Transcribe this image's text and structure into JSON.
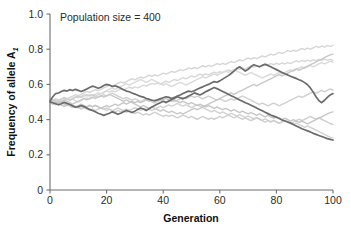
{
  "chart_data": {
    "type": "line",
    "title": "",
    "annotation": "Population size = 400",
    "xlabel": "Generation",
    "ylabel": "Frequency of allele A",
    "ylabel_subscript": "1",
    "xlim": [
      0,
      100
    ],
    "ylim": [
      0,
      1.0
    ],
    "x_ticks": [
      0,
      20,
      40,
      60,
      80,
      100
    ],
    "x_tick_labels": [
      "0",
      "20",
      "40",
      "60",
      "80",
      "100"
    ],
    "y_ticks": [
      0,
      0.2,
      0.4,
      0.6,
      0.8,
      1.0
    ],
    "y_tick_labels": [
      "0",
      "0.2",
      "0.4",
      "0.6",
      "0.8",
      "1.0"
    ],
    "grid": false,
    "legend": "none",
    "x_step": 1,
    "colors": {
      "dark_line": "#6b6b6b",
      "light_line": "#d4d4d4",
      "mid_line": "#c2c2c2",
      "axis": "#6e6e6e",
      "text": "#2b2b2b"
    },
    "series": [
      {
        "name": "replicate-1-dark",
        "color": "#6b6b6b",
        "width": 1.7,
        "values": [
          0.506,
          0.53,
          0.548,
          0.551,
          0.56,
          0.566,
          0.562,
          0.57,
          0.565,
          0.572,
          0.566,
          0.56,
          0.566,
          0.574,
          0.582,
          0.59,
          0.585,
          0.578,
          0.584,
          0.594,
          0.6,
          0.596,
          0.588,
          0.592,
          0.586,
          0.578,
          0.57,
          0.562,
          0.558,
          0.551,
          0.545,
          0.538,
          0.532,
          0.528,
          0.52,
          0.516,
          0.51,
          0.508,
          0.512,
          0.518,
          0.524,
          0.53,
          0.526,
          0.52,
          0.526,
          0.534,
          0.54,
          0.548,
          0.556,
          0.562,
          0.558,
          0.564,
          0.572,
          0.58,
          0.586,
          0.594,
          0.6,
          0.608,
          0.616,
          0.612,
          0.62,
          0.63,
          0.64,
          0.65,
          0.662,
          0.676,
          0.69,
          0.7,
          0.688,
          0.676,
          0.686,
          0.7,
          0.712,
          0.706,
          0.7,
          0.708,
          0.714,
          0.708,
          0.7,
          0.692,
          0.684,
          0.676,
          0.668,
          0.66,
          0.654,
          0.646,
          0.64,
          0.634,
          0.626,
          0.62,
          0.61,
          0.598,
          0.58,
          0.556,
          0.53,
          0.508,
          0.496,
          0.51,
          0.526,
          0.54,
          0.548
        ]
      },
      {
        "name": "replicate-2-dark",
        "color": "#6b6b6b",
        "width": 1.7,
        "values": [
          0.5,
          0.496,
          0.49,
          0.484,
          0.49,
          0.498,
          0.492,
          0.486,
          0.478,
          0.47,
          0.474,
          0.48,
          0.474,
          0.466,
          0.458,
          0.452,
          0.444,
          0.436,
          0.43,
          0.424,
          0.43,
          0.436,
          0.444,
          0.438,
          0.43,
          0.436,
          0.444,
          0.452,
          0.446,
          0.44,
          0.448,
          0.458,
          0.466,
          0.46,
          0.452,
          0.462,
          0.472,
          0.48,
          0.488,
          0.496,
          0.504,
          0.498,
          0.506,
          0.514,
          0.522,
          0.53,
          0.524,
          0.518,
          0.526,
          0.534,
          0.542,
          0.552,
          0.546,
          0.54,
          0.548,
          0.558,
          0.566,
          0.574,
          0.582,
          0.576,
          0.568,
          0.56,
          0.552,
          0.544,
          0.536,
          0.528,
          0.52,
          0.512,
          0.504,
          0.496,
          0.49,
          0.482,
          0.474,
          0.466,
          0.458,
          0.45,
          0.442,
          0.434,
          0.426,
          0.42,
          0.414,
          0.406,
          0.398,
          0.392,
          0.386,
          0.38,
          0.372,
          0.364,
          0.356,
          0.348,
          0.342,
          0.336,
          0.33,
          0.322,
          0.316,
          0.31,
          0.304,
          0.298,
          0.292,
          0.288,
          0.284
        ]
      },
      {
        "name": "replicate-3-light",
        "color": "#d6d6d6",
        "width": 1.4,
        "values": [
          0.5,
          0.506,
          0.514,
          0.508,
          0.516,
          0.524,
          0.518,
          0.526,
          0.534,
          0.542,
          0.536,
          0.544,
          0.552,
          0.56,
          0.554,
          0.562,
          0.57,
          0.564,
          0.572,
          0.58,
          0.588,
          0.596,
          0.59,
          0.598,
          0.606,
          0.614,
          0.608,
          0.616,
          0.624,
          0.632,
          0.626,
          0.634,
          0.642,
          0.636,
          0.644,
          0.652,
          0.646,
          0.654,
          0.648,
          0.656,
          0.664,
          0.658,
          0.666,
          0.674,
          0.668,
          0.676,
          0.684,
          0.678,
          0.686,
          0.694,
          0.688,
          0.696,
          0.69,
          0.698,
          0.706,
          0.7,
          0.708,
          0.702,
          0.71,
          0.718,
          0.712,
          0.72,
          0.714,
          0.722,
          0.73,
          0.724,
          0.732,
          0.74,
          0.734,
          0.742,
          0.75,
          0.744,
          0.752,
          0.746,
          0.754,
          0.762,
          0.756,
          0.764,
          0.772,
          0.766,
          0.774,
          0.782,
          0.776,
          0.784,
          0.792,
          0.786,
          0.794,
          0.788,
          0.796,
          0.804,
          0.798,
          0.806,
          0.8,
          0.808,
          0.816,
          0.81,
          0.818,
          0.812,
          0.82,
          0.816,
          0.822
        ]
      },
      {
        "name": "replicate-4-light",
        "color": "#d8d8d8",
        "width": 1.4,
        "values": [
          0.5,
          0.494,
          0.502,
          0.51,
          0.504,
          0.512,
          0.52,
          0.514,
          0.522,
          0.53,
          0.524,
          0.532,
          0.54,
          0.534,
          0.542,
          0.536,
          0.544,
          0.552,
          0.546,
          0.554,
          0.562,
          0.556,
          0.564,
          0.558,
          0.566,
          0.574,
          0.568,
          0.576,
          0.584,
          0.578,
          0.586,
          0.58,
          0.588,
          0.596,
          0.59,
          0.598,
          0.606,
          0.6,
          0.608,
          0.602,
          0.61,
          0.618,
          0.612,
          0.62,
          0.628,
          0.622,
          0.63,
          0.638,
          0.632,
          0.64,
          0.648,
          0.642,
          0.65,
          0.658,
          0.652,
          0.66,
          0.654,
          0.662,
          0.67,
          0.664,
          0.672,
          0.666,
          0.674,
          0.682,
          0.676,
          0.684,
          0.692,
          0.686,
          0.694,
          0.688,
          0.696,
          0.704,
          0.698,
          0.706,
          0.7,
          0.708,
          0.716,
          0.71,
          0.718,
          0.712,
          0.72,
          0.714,
          0.722,
          0.716,
          0.724,
          0.718,
          0.726,
          0.734,
          0.728,
          0.736,
          0.73,
          0.738,
          0.732,
          0.74,
          0.734,
          0.742,
          0.736,
          0.744,
          0.738,
          0.742,
          0.736
        ]
      },
      {
        "name": "replicate-5-light",
        "color": "#dadada",
        "width": 1.4,
        "values": [
          0.5,
          0.508,
          0.5,
          0.492,
          0.5,
          0.508,
          0.516,
          0.508,
          0.516,
          0.508,
          0.5,
          0.508,
          0.516,
          0.524,
          0.516,
          0.524,
          0.532,
          0.54,
          0.548,
          0.556,
          0.564,
          0.572,
          0.58,
          0.572,
          0.58,
          0.588,
          0.596,
          0.604,
          0.596,
          0.604,
          0.612,
          0.62,
          0.628,
          0.62,
          0.612,
          0.62,
          0.628,
          0.62,
          0.612,
          0.604,
          0.596,
          0.604,
          0.596,
          0.588,
          0.596,
          0.604,
          0.612,
          0.604,
          0.596,
          0.604,
          0.612,
          0.62,
          0.628,
          0.636,
          0.644,
          0.636,
          0.644,
          0.652,
          0.66,
          0.652,
          0.66,
          0.668,
          0.676,
          0.668,
          0.676,
          0.684,
          0.676,
          0.668,
          0.66,
          0.652,
          0.66,
          0.668,
          0.66,
          0.652,
          0.644,
          0.636,
          0.644,
          0.652,
          0.66,
          0.652,
          0.66,
          0.668,
          0.66,
          0.668,
          0.676,
          0.684,
          0.676,
          0.684,
          0.692,
          0.7,
          0.692,
          0.7,
          0.708,
          0.7,
          0.708,
          0.716,
          0.724,
          0.716,
          0.724,
          0.732,
          0.726
        ]
      },
      {
        "name": "replicate-6-light",
        "color": "#d2d2d2",
        "width": 1.4,
        "values": [
          0.5,
          0.492,
          0.484,
          0.492,
          0.484,
          0.476,
          0.484,
          0.476,
          0.468,
          0.476,
          0.468,
          0.46,
          0.468,
          0.46,
          0.452,
          0.46,
          0.452,
          0.46,
          0.468,
          0.46,
          0.452,
          0.46,
          0.452,
          0.444,
          0.452,
          0.444,
          0.452,
          0.46,
          0.452,
          0.46,
          0.468,
          0.46,
          0.452,
          0.46,
          0.468,
          0.46,
          0.452,
          0.46,
          0.468,
          0.476,
          0.468,
          0.476,
          0.484,
          0.476,
          0.484,
          0.492,
          0.484,
          0.476,
          0.484,
          0.476,
          0.468,
          0.476,
          0.484,
          0.476,
          0.468,
          0.46,
          0.452,
          0.444,
          0.452,
          0.444,
          0.436,
          0.444,
          0.436,
          0.428,
          0.436,
          0.428,
          0.42,
          0.428,
          0.42,
          0.412,
          0.42,
          0.412,
          0.404,
          0.412,
          0.404,
          0.396,
          0.404,
          0.396,
          0.388,
          0.396,
          0.388,
          0.38,
          0.388,
          0.396,
          0.388,
          0.38,
          0.372,
          0.38,
          0.372,
          0.364,
          0.356,
          0.364,
          0.356,
          0.348,
          0.34,
          0.332,
          0.324,
          0.316,
          0.308,
          0.3,
          0.296
        ]
      },
      {
        "name": "replicate-7-light",
        "color": "#d0d0d0",
        "width": 1.4,
        "values": [
          0.502,
          0.51,
          0.518,
          0.51,
          0.518,
          0.526,
          0.518,
          0.51,
          0.518,
          0.526,
          0.534,
          0.526,
          0.534,
          0.542,
          0.534,
          0.542,
          0.534,
          0.526,
          0.534,
          0.542,
          0.534,
          0.542,
          0.55,
          0.542,
          0.534,
          0.526,
          0.518,
          0.526,
          0.518,
          0.51,
          0.518,
          0.51,
          0.502,
          0.51,
          0.518,
          0.51,
          0.502,
          0.494,
          0.502,
          0.51,
          0.502,
          0.494,
          0.502,
          0.51,
          0.502,
          0.51,
          0.518,
          0.526,
          0.518,
          0.526,
          0.534,
          0.526,
          0.534,
          0.526,
          0.518,
          0.526,
          0.534,
          0.526,
          0.518,
          0.51,
          0.518,
          0.51,
          0.502,
          0.51,
          0.518,
          0.51,
          0.518,
          0.526,
          0.534,
          0.526,
          0.518,
          0.51,
          0.502,
          0.494,
          0.486,
          0.494,
          0.486,
          0.478,
          0.486,
          0.494,
          0.486,
          0.478,
          0.486,
          0.494,
          0.502,
          0.51,
          0.518,
          0.526,
          0.534,
          0.526,
          0.534,
          0.542,
          0.55,
          0.558,
          0.55,
          0.558,
          0.566,
          0.558,
          0.566,
          0.574,
          0.568
        ]
      },
      {
        "name": "replicate-8-light",
        "color": "#cfcfcf",
        "width": 1.4,
        "values": [
          0.498,
          0.49,
          0.498,
          0.49,
          0.482,
          0.474,
          0.482,
          0.49,
          0.482,
          0.474,
          0.466,
          0.474,
          0.466,
          0.474,
          0.482,
          0.474,
          0.482,
          0.474,
          0.466,
          0.458,
          0.466,
          0.458,
          0.45,
          0.458,
          0.466,
          0.458,
          0.45,
          0.442,
          0.45,
          0.442,
          0.434,
          0.442,
          0.434,
          0.426,
          0.434,
          0.426,
          0.434,
          0.442,
          0.434,
          0.426,
          0.418,
          0.426,
          0.418,
          0.426,
          0.418,
          0.41,
          0.418,
          0.426,
          0.418,
          0.41,
          0.418,
          0.41,
          0.402,
          0.41,
          0.418,
          0.41,
          0.402,
          0.41,
          0.402,
          0.41,
          0.418,
          0.41,
          0.418,
          0.426,
          0.418,
          0.41,
          0.418,
          0.41,
          0.402,
          0.41,
          0.402,
          0.394,
          0.402,
          0.41,
          0.402,
          0.394,
          0.386,
          0.394,
          0.386,
          0.394,
          0.386,
          0.378,
          0.386,
          0.394,
          0.386,
          0.378,
          0.386,
          0.394,
          0.402,
          0.394,
          0.402,
          0.41,
          0.418,
          0.41,
          0.402,
          0.41,
          0.402,
          0.394,
          0.386,
          0.378,
          0.372
        ]
      },
      {
        "name": "replicate-9-light",
        "color": "#c8c8c8",
        "width": 1.4,
        "values": [
          0.504,
          0.512,
          0.504,
          0.496,
          0.504,
          0.512,
          0.504,
          0.496,
          0.488,
          0.496,
          0.504,
          0.512,
          0.52,
          0.512,
          0.52,
          0.528,
          0.52,
          0.528,
          0.536,
          0.528,
          0.536,
          0.544,
          0.536,
          0.528,
          0.52,
          0.512,
          0.504,
          0.512,
          0.504,
          0.496,
          0.488,
          0.48,
          0.472,
          0.48,
          0.472,
          0.464,
          0.472,
          0.464,
          0.456,
          0.448,
          0.456,
          0.448,
          0.44,
          0.448,
          0.44,
          0.432,
          0.44,
          0.432,
          0.44,
          0.448,
          0.456,
          0.464,
          0.456,
          0.464,
          0.472,
          0.48,
          0.488,
          0.496,
          0.504,
          0.512,
          0.52,
          0.528,
          0.536,
          0.544,
          0.552,
          0.544,
          0.552,
          0.56,
          0.568,
          0.576,
          0.584,
          0.592,
          0.6,
          0.592,
          0.6,
          0.608,
          0.616,
          0.624,
          0.632,
          0.64,
          0.648,
          0.656,
          0.648,
          0.656,
          0.664,
          0.672,
          0.68,
          0.688,
          0.68,
          0.688,
          0.696,
          0.704,
          0.712,
          0.72,
          0.728,
          0.736,
          0.744,
          0.752,
          0.76,
          0.768,
          0.772
        ]
      },
      {
        "name": "replicate-10-light",
        "color": "#c6c6c6",
        "width": 1.4,
        "values": [
          0.496,
          0.488,
          0.496,
          0.504,
          0.496,
          0.488,
          0.48,
          0.488,
          0.48,
          0.472,
          0.48,
          0.488,
          0.48,
          0.472,
          0.48,
          0.472,
          0.48,
          0.472,
          0.464,
          0.472,
          0.48,
          0.472,
          0.48,
          0.488,
          0.48,
          0.488,
          0.496,
          0.488,
          0.496,
          0.504,
          0.496,
          0.504,
          0.496,
          0.504,
          0.512,
          0.504,
          0.512,
          0.504,
          0.512,
          0.52,
          0.512,
          0.52,
          0.512,
          0.504,
          0.512,
          0.504,
          0.496,
          0.504,
          0.496,
          0.488,
          0.496,
          0.488,
          0.48,
          0.488,
          0.48,
          0.472,
          0.48,
          0.472,
          0.464,
          0.472,
          0.464,
          0.456,
          0.464,
          0.456,
          0.448,
          0.456,
          0.448,
          0.44,
          0.448,
          0.44,
          0.432,
          0.44,
          0.432,
          0.424,
          0.432,
          0.424,
          0.416,
          0.424,
          0.416,
          0.408,
          0.416,
          0.408,
          0.4,
          0.408,
          0.4,
          0.392,
          0.4,
          0.392,
          0.384,
          0.392,
          0.384,
          0.376,
          0.384,
          0.392,
          0.4,
          0.408,
          0.416,
          0.424,
          0.432,
          0.44,
          0.444
        ]
      }
    ]
  },
  "axes": {
    "y_title_main": "Frequency of allele A",
    "y_title_sub": "1",
    "x_title": "Generation"
  }
}
